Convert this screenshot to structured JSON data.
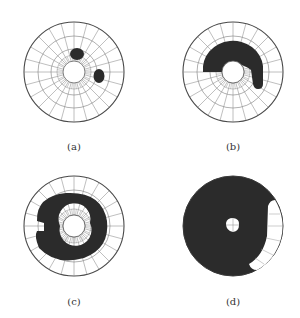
{
  "header": {
    "cropped_text": "·· ·· ······· ·· ···· ····· ········· ··········· ····· ········"
  },
  "figure": {
    "panels": [
      {
        "id": "a",
        "label": "(a)",
        "cx": 74,
        "cy": 72,
        "r": 50,
        "description": "polar grid with two small dark spots"
      },
      {
        "id": "b",
        "label": "(b)",
        "cx": 233,
        "cy": 72,
        "r": 50,
        "description": "polar grid with dark crescent arc over the upper half"
      },
      {
        "id": "c",
        "label": "(c)",
        "cx": 74,
        "cy": 226,
        "r": 50,
        "description": "polar grid with dark spiral band around the center"
      },
      {
        "id": "d",
        "label": "(d)",
        "cx": 233,
        "cy": 226,
        "r": 50,
        "description": "almost fully dark disk with a small white region at lower right and a small center hole"
      }
    ]
  },
  "colors": {
    "grid": "#6e6e6e",
    "outline": "#4a4a4a",
    "fill_dark": "#2b2b2b",
    "background": "#ffffff"
  }
}
